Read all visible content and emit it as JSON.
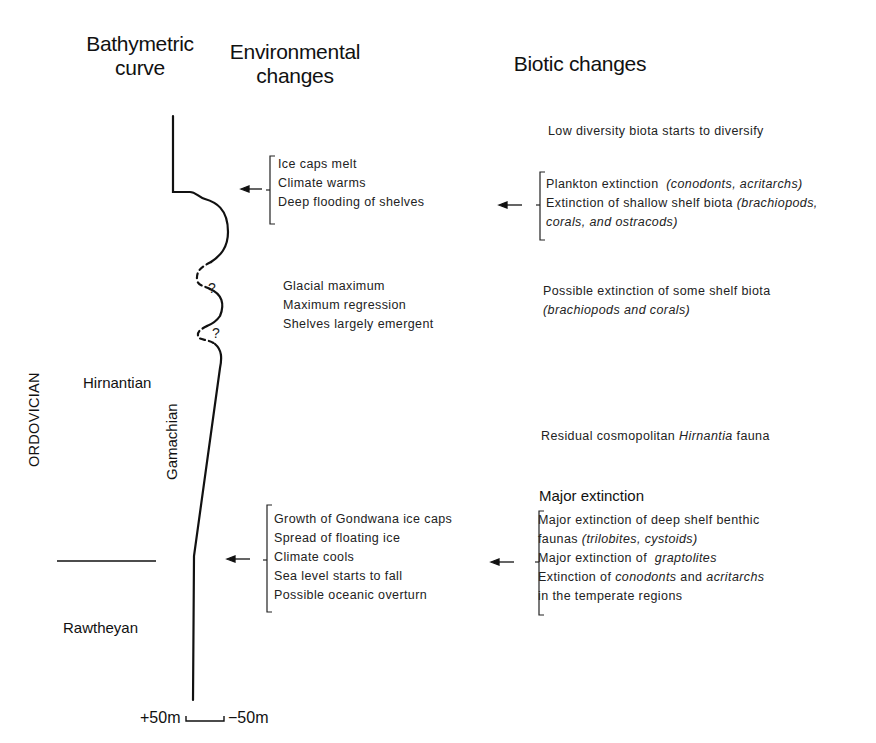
{
  "headers": {
    "bathymetric": [
      "Bathymetric",
      "curve"
    ],
    "environmental": [
      "Environmental",
      "changes"
    ],
    "biotic": "Biotic changes"
  },
  "stratigraphy": {
    "system": "ORDOVICIAN",
    "stage_upper": "Hirnantian",
    "stage_lower": "Rawtheyan",
    "substage": "Gamachian"
  },
  "scale": {
    "left": "+50m",
    "right": "−50m"
  },
  "curve_markers": [
    "?",
    "?"
  ],
  "environmental": {
    "group_warming": [
      "Ice caps melt",
      "Climate warms",
      "Deep flooding of shelves"
    ],
    "group_glacial": [
      "Glacial maximum",
      "Maximum regression",
      "Shelves largely emergent"
    ],
    "group_cooling": [
      "Growth of Gondwana ice caps",
      "Spread of floating ice",
      "Climate cools",
      "Sea level starts to fall",
      "Possible oceanic overturn"
    ]
  },
  "biotic": {
    "diversify": "Low diversity biota starts to diversify",
    "group_upper": [
      {
        "text": "Plankton extinction",
        "italic": "(conodonts, acritarchs)"
      },
      {
        "text": "Extinction of shallow shelf biota",
        "italic": "(brachiopods,"
      },
      {
        "text": "",
        "italic": "corals, and ostracods)"
      }
    ],
    "possible": {
      "text": "Possible extinction of some shelf biota",
      "italic": "(brachiopods and corals)"
    },
    "residual": {
      "pre": "Residual cosmopolitan",
      "italic": "Hirnantia",
      "post": "fauna"
    },
    "major_heading": "Major extinction",
    "group_lower": {
      "line1": "Major extinction of deep shelf benthic",
      "line2_pre": "faunas",
      "line2_italic": "(trilobites, cystoids)",
      "line3_pre": "Major extinction of",
      "line3_italic": "graptolites",
      "line4_pre": "Extinction of",
      "line4_italic1": "conodonts",
      "line4_mid": "and",
      "line4_italic2": "acritarchs",
      "line5": "in the temperate regions"
    }
  },
  "arrows": [
    "arrow-to-curve-upper",
    "arrow-to-env-upper",
    "arrow-to-curve-lower",
    "arrow-to-env-lower"
  ]
}
